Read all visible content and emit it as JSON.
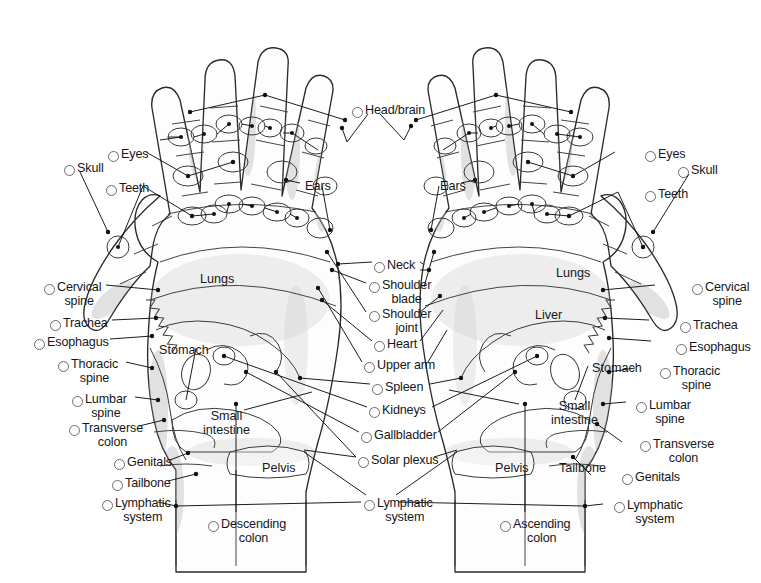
{
  "diagram": {
    "type": "anatomical-reflexology-map",
    "background_color": "#ffffff",
    "ink_color": "#17171a",
    "line_color": "#3a3a3a",
    "shade_color": "#b9b9b9",
    "bullet_style": "open-circle"
  },
  "center_labels": [
    {
      "id": "head-brain",
      "text": "Head/brain",
      "x": 352,
      "y": 104,
      "align": "left",
      "bullet": "left"
    },
    {
      "id": "neck",
      "text": "Neck",
      "x": 374,
      "y": 259,
      "align": "left",
      "bullet": "left"
    },
    {
      "id": "shoulder-blade",
      "text": "Shoulder\nblade",
      "x": 369,
      "y": 279,
      "align": "left",
      "bullet": "left"
    },
    {
      "id": "shoulder-joint",
      "text": "Shoulder\njoint",
      "x": 369,
      "y": 308,
      "align": "left",
      "bullet": "left"
    },
    {
      "id": "heart",
      "text": "Heart",
      "x": 374,
      "y": 338,
      "align": "left",
      "bullet": "left"
    },
    {
      "id": "upper-arm",
      "text": "Upper arm",
      "x": 364,
      "y": 359,
      "align": "left",
      "bullet": "left"
    },
    {
      "id": "spleen",
      "text": "Spleen",
      "x": 372,
      "y": 381,
      "align": "left",
      "bullet": "left"
    },
    {
      "id": "kidneys",
      "text": "Kidneys",
      "x": 369,
      "y": 404,
      "align": "left",
      "bullet": "left"
    },
    {
      "id": "gallbladder",
      "text": "Gallbladder",
      "x": 361,
      "y": 429,
      "align": "left",
      "bullet": "left"
    },
    {
      "id": "solar-plexus",
      "text": "Solar plexus",
      "x": 358,
      "y": 454,
      "align": "left",
      "bullet": "left"
    },
    {
      "id": "lymphatic-system-center",
      "text": "Lymphatic\nsystem",
      "x": 364,
      "y": 497,
      "align": "left",
      "bullet": "left"
    }
  ],
  "left_labels": [
    {
      "id": "skull-left",
      "text": "Skull",
      "x": 64,
      "y": 162,
      "align": "left",
      "bullet": "left"
    },
    {
      "id": "eyes-left",
      "text": "Eyes",
      "x": 108,
      "y": 148,
      "align": "left",
      "bullet": "left"
    },
    {
      "id": "teeth-left",
      "text": "Teeth",
      "x": 106,
      "y": 182,
      "align": "left",
      "bullet": "left"
    },
    {
      "id": "cervical-spine-left",
      "text": "Cervical\nspine",
      "x": 44,
      "y": 281,
      "align": "left",
      "bullet": "left"
    },
    {
      "id": "trachea-left",
      "text": "Trachea",
      "x": 50,
      "y": 317,
      "align": "left",
      "bullet": "left"
    },
    {
      "id": "esophagus-left",
      "text": "Esophagus",
      "x": 34,
      "y": 336,
      "align": "left",
      "bullet": "left"
    },
    {
      "id": "thoracic-spine-left",
      "text": "Thoracic\nspine",
      "x": 58,
      "y": 358,
      "align": "left",
      "bullet": "left"
    },
    {
      "id": "lumbar-spine-left",
      "text": "Lumbar\nspine",
      "x": 72,
      "y": 393,
      "align": "left",
      "bullet": "left"
    },
    {
      "id": "transverse-colon-left",
      "text": "Transverse\ncolon",
      "x": 69,
      "y": 422,
      "align": "left",
      "bullet": "left"
    },
    {
      "id": "genitals-left",
      "text": "Genitals",
      "x": 114,
      "y": 456,
      "align": "left",
      "bullet": "left"
    },
    {
      "id": "tailbone-left",
      "text": "Tailbone",
      "x": 112,
      "y": 477,
      "align": "left",
      "bullet": "left"
    },
    {
      "id": "lymphatic-system-left",
      "text": "Lymphatic\nsystem",
      "x": 102,
      "y": 497,
      "align": "left",
      "bullet": "left"
    }
  ],
  "right_labels": [
    {
      "id": "eyes-right",
      "text": "Eyes",
      "x": 645,
      "y": 148,
      "align": "left",
      "bullet": "left"
    },
    {
      "id": "skull-right",
      "text": "Skull",
      "x": 678,
      "y": 164,
      "align": "left",
      "bullet": "left"
    },
    {
      "id": "teeth-right",
      "text": "Teeth",
      "x": 645,
      "y": 188,
      "align": "left",
      "bullet": "left"
    },
    {
      "id": "cervical-spine-right",
      "text": "Cervical\nspine",
      "x": 692,
      "y": 281,
      "align": "left",
      "bullet": "left"
    },
    {
      "id": "trachea-right",
      "text": "Trachea",
      "x": 680,
      "y": 319,
      "align": "left",
      "bullet": "left"
    },
    {
      "id": "esophagus-right",
      "text": "Esophagus",
      "x": 676,
      "y": 341,
      "align": "left",
      "bullet": "left"
    },
    {
      "id": "thoracic-spine-right",
      "text": "Thoracic\nspine",
      "x": 660,
      "y": 365,
      "align": "left",
      "bullet": "left"
    },
    {
      "id": "lumbar-spine-right",
      "text": "Lumbar\nspine",
      "x": 636,
      "y": 399,
      "align": "left",
      "bullet": "left"
    },
    {
      "id": "transverse-colon-right",
      "text": "Transverse\ncolon",
      "x": 640,
      "y": 438,
      "align": "left",
      "bullet": "left"
    },
    {
      "id": "genitals-right",
      "text": "Genitals",
      "x": 622,
      "y": 471,
      "align": "left",
      "bullet": "left"
    },
    {
      "id": "lymphatic-system-right",
      "text": "Lymphatic\nsystem",
      "x": 614,
      "y": 499,
      "align": "left",
      "bullet": "left"
    }
  ],
  "bottom_labels": [
    {
      "id": "descending-colon",
      "text": "Descending\ncolon",
      "x": 208,
      "y": 518,
      "align": "left",
      "bullet": "left"
    },
    {
      "id": "ascending-colon",
      "text": "Ascending\ncolon",
      "x": 500,
      "y": 518,
      "align": "left",
      "bullet": "left"
    }
  ],
  "inner_labels": [
    {
      "id": "lungs-left",
      "text": "Lungs",
      "x": 200,
      "y": 273
    },
    {
      "id": "lungs-right",
      "text": "Lungs",
      "x": 556,
      "y": 267
    },
    {
      "id": "liver-right",
      "text": "Liver",
      "x": 535,
      "y": 309
    },
    {
      "id": "stomach-left",
      "text": "Stomach",
      "x": 159,
      "y": 344
    },
    {
      "id": "stomach-right",
      "text": "Stomach",
      "x": 592,
      "y": 362
    },
    {
      "id": "ears-left",
      "text": "Ears",
      "x": 305,
      "y": 180
    },
    {
      "id": "ears-right",
      "text": "Ears",
      "x": 440,
      "y": 180
    },
    {
      "id": "small-intestine-left",
      "text": "Small\nintestine",
      "x": 203,
      "y": 410
    },
    {
      "id": "small-intestine-right",
      "text": "Small\nintestine",
      "x": 551,
      "y": 400
    },
    {
      "id": "pelvis-left",
      "text": "Pelvis",
      "x": 262,
      "y": 462
    },
    {
      "id": "pelvis-right",
      "text": "Pelvis",
      "x": 495,
      "y": 462
    },
    {
      "id": "tailbone-right",
      "text": "Tailbone",
      "x": 559,
      "y": 462
    }
  ]
}
